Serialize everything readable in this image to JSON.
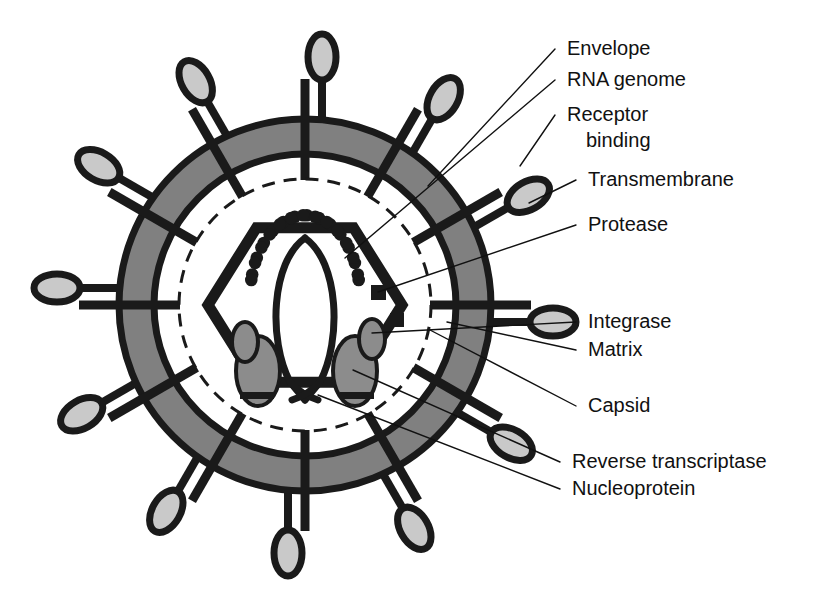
{
  "figure": {
    "background_color": "#ffffff",
    "ink_color": "#1a1a1a",
    "envelope_fill": "#808080",
    "knob_fill": "#c9c9c9",
    "enzyme_fill": "#8c8c8c"
  },
  "labels": [
    {
      "id": "envelope",
      "text": "Envelope",
      "x": 567,
      "y": 55,
      "target_x": 428,
      "target_y": 186,
      "has_leader": true
    },
    {
      "id": "rna-genome",
      "text": "RNA genome",
      "x": 567,
      "y": 86,
      "target_x": 345,
      "target_y": 258,
      "has_leader": true
    },
    {
      "id": "receptor-binding-1",
      "text": "Receptor",
      "x": 567,
      "y": 121,
      "target_x": 520,
      "target_y": 166,
      "has_leader": true
    },
    {
      "id": "receptor-binding-2",
      "text": "binding",
      "x": 586,
      "y": 147,
      "target_x": null,
      "target_y": null,
      "has_leader": false
    },
    {
      "id": "transmembrane",
      "text": "Transmembrane",
      "x": 588,
      "y": 186,
      "target_x": 529,
      "target_y": 203,
      "has_leader": true
    },
    {
      "id": "protease",
      "text": "Protease",
      "x": 588,
      "y": 231,
      "target_x": 378,
      "target_y": 292,
      "has_leader": true
    },
    {
      "id": "integrase",
      "text": "Integrase",
      "x": 588,
      "y": 328,
      "target_x": 372,
      "target_y": 333,
      "has_leader": true
    },
    {
      "id": "matrix",
      "text": "Matrix",
      "x": 588,
      "y": 356,
      "target_x": 447,
      "target_y": 322,
      "has_leader": true
    },
    {
      "id": "capsid",
      "text": "Capsid",
      "x": 588,
      "y": 412,
      "target_x": 430,
      "target_y": 330,
      "has_leader": true
    },
    {
      "id": "reverse-transcriptase",
      "text": "Reverse transcriptase",
      "x": 572,
      "y": 468,
      "target_x": 353,
      "target_y": 370,
      "has_leader": true
    },
    {
      "id": "nucleoprotein",
      "text": "Nucleoprotein",
      "x": 572,
      "y": 495,
      "target_x": 318,
      "target_y": 395,
      "has_leader": true
    }
  ],
  "structure": {
    "center_x": 305,
    "center_y": 305,
    "envelope_outer_radius": 186,
    "envelope_inner_radius": 151,
    "matrix_radius": 126,
    "capsid_radius": 97,
    "capsid_shape": "hexagon",
    "spike_count": 12,
    "nucleoprotein_dot_count": 26,
    "rna_strand_count": 2,
    "reverse_transcriptase_count": 2,
    "integrase_count": 2,
    "protease_count": 2
  },
  "components": [
    {
      "name": "Envelope",
      "description": "lipid bilayer shown as grey annulus"
    },
    {
      "name": "RNA genome",
      "description": "two curved strands forming a lens shape"
    },
    {
      "name": "Receptor binding",
      "description": "gp120 knob at tip of each spike"
    },
    {
      "name": "Transmembrane",
      "description": "gp41 bar spanning the envelope"
    },
    {
      "name": "Protease",
      "description": "small black square inside capsid"
    },
    {
      "name": "Integrase",
      "description": "small grey ellipse inside capsid"
    },
    {
      "name": "Matrix",
      "description": "dashed circle beneath the envelope"
    },
    {
      "name": "Capsid",
      "description": "hexagonal core shell"
    },
    {
      "name": "Reverse transcriptase",
      "description": "large grey ellipse inside capsid"
    },
    {
      "name": "Nucleoprotein",
      "description": "ring of black dots around the genome"
    }
  ],
  "spikes": [
    {
      "angle": -90,
      "knob_side": "left"
    },
    {
      "angle": -60,
      "knob_side": "left"
    },
    {
      "angle": -30,
      "knob_side": "left"
    },
    {
      "angle": 0,
      "knob_side": "left"
    },
    {
      "angle": 30,
      "knob_side": "left"
    },
    {
      "angle": 60,
      "knob_side": "left"
    },
    {
      "angle": 90,
      "knob_side": "left"
    },
    {
      "angle": 120,
      "knob_side": "left"
    },
    {
      "angle": 150,
      "knob_side": "left"
    },
    {
      "angle": 180,
      "knob_side": "left"
    },
    {
      "angle": 210,
      "knob_side": "left"
    },
    {
      "angle": 240,
      "knob_side": "left"
    }
  ]
}
